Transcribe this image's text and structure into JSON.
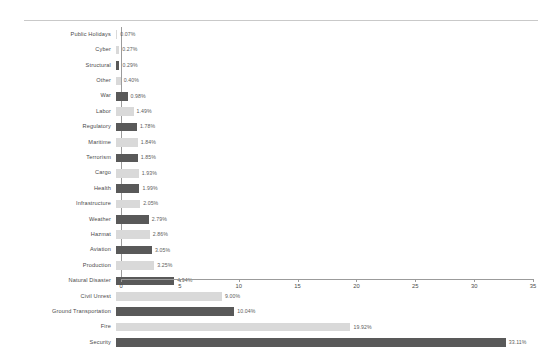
{
  "chart_data": {
    "type": "bar",
    "orientation": "horizontal",
    "title": "",
    "xlabel": "",
    "ylabel": "",
    "xlim": [
      0,
      35
    ],
    "xticks": [
      0,
      5,
      10,
      15,
      20,
      25,
      30,
      35
    ],
    "grid": false,
    "legend": null,
    "value_suffix": "%",
    "categories": [
      "Public Holidays",
      "Cyber",
      "Structural",
      "Other",
      "War",
      "Labor",
      "Regulatory",
      "Maritime",
      "Terrorism",
      "Cargo",
      "Health",
      "Infrastructure",
      "Weather",
      "Hazmat",
      "Aviation",
      "Production",
      "Natural Disaster",
      "Civil Unrest",
      "Ground Transportation",
      "Fire",
      "Security"
    ],
    "values": [
      0.07,
      0.27,
      0.29,
      0.4,
      0.98,
      1.49,
      1.78,
      1.84,
      1.85,
      1.93,
      1.99,
      2.05,
      2.79,
      2.86,
      3.05,
      3.25,
      4.94,
      9.0,
      10.04,
      19.92,
      33.11
    ],
    "value_labels": [
      "0.07%",
      "0.27%",
      "0.29%",
      "0.40%",
      "0.98%",
      "1.49%",
      "1.78%",
      "1.84%",
      "1.85%",
      "1.93%",
      "1.99%",
      "2.05%",
      "2.79%",
      "2.86%",
      "3.05%",
      "3.25%",
      "4.94%",
      "9.00%",
      "10.04%",
      "19.92%",
      "33.11%"
    ],
    "bar_shades": [
      "light",
      "light",
      "dark",
      "light",
      "dark",
      "light",
      "dark",
      "light",
      "dark",
      "light",
      "dark",
      "light",
      "dark",
      "light",
      "dark",
      "light",
      "dark",
      "light",
      "dark",
      "light",
      "dark"
    ],
    "colors": {
      "light": "#d9d9d9",
      "dark": "#595959",
      "axis": "#9b9b9b",
      "text": "#4a4a4a",
      "background": "#ffffff"
    }
  }
}
